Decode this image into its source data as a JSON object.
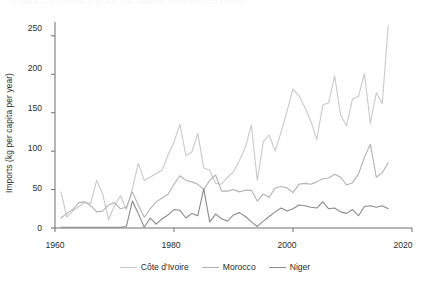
{
  "figure": {
    "clipped_top_text": "Figure 3.2  Cereal imports per capita, selected countries"
  },
  "chart_data": {
    "type": "line",
    "title": "",
    "xlabel": "",
    "ylabel": "Imports (kg per capita per year)",
    "xlim": [
      1960,
      2020
    ],
    "ylim": [
      0,
      268
    ],
    "xticks": [
      1960,
      1980,
      2000,
      2020
    ],
    "yticks": [
      0,
      50,
      100,
      150,
      200,
      250
    ],
    "grid": false,
    "legend_position": "bottom-center",
    "x": [
      1961,
      1962,
      1963,
      1964,
      1965,
      1966,
      1967,
      1968,
      1969,
      1970,
      1971,
      1972,
      1973,
      1974,
      1975,
      1976,
      1977,
      1978,
      1979,
      1980,
      1981,
      1982,
      1983,
      1984,
      1985,
      1986,
      1987,
      1988,
      1989,
      1990,
      1991,
      1992,
      1993,
      1994,
      1995,
      1996,
      1997,
      1998,
      1999,
      2000,
      2001,
      2002,
      2003,
      2004,
      2005,
      2006,
      2007,
      2008,
      2009,
      2010,
      2011,
      2012,
      2013,
      2014,
      2015,
      2016
    ],
    "series": [
      {
        "name": "Côte d'Ivoire",
        "color": "#c9c9c9",
        "values": [
          47,
          14,
          22,
          28,
          33,
          32,
          62,
          45,
          11,
          29,
          42,
          24,
          51,
          84,
          62,
          66,
          71,
          75,
          95,
          112,
          135,
          94,
          99,
          123,
          78,
          75,
          58,
          57,
          66,
          73,
          88,
          105,
          134,
          62,
          112,
          121,
          100,
          125,
          152,
          181,
          172,
          157,
          139,
          115,
          160,
          163,
          198,
          147,
          133,
          168,
          171,
          201,
          136,
          176,
          162,
          263
        ]
      },
      {
        "name": "Morocco",
        "color": "#b2b2b2",
        "values": [
          13,
          19,
          24,
          33,
          34,
          29,
          21,
          22,
          30,
          33,
          25,
          27,
          47,
          30,
          14,
          25,
          34,
          39,
          44,
          57,
          68,
          62,
          60,
          57,
          50,
          62,
          69,
          48,
          48,
          50,
          47,
          49,
          49,
          35,
          44,
          40,
          52,
          54,
          52,
          46,
          57,
          58,
          57,
          60,
          64,
          65,
          70,
          66,
          56,
          59,
          70,
          92,
          109,
          66,
          72,
          85
        ]
      },
      {
        "name": "Niger",
        "color": "#8a8a8a",
        "values": [
          1,
          1,
          1,
          1,
          1,
          1,
          1,
          1,
          1,
          1,
          1,
          2,
          35,
          19,
          1,
          13,
          5,
          12,
          17,
          24,
          23,
          13,
          19,
          16,
          51,
          8,
          18,
          12,
          9,
          17,
          20,
          15,
          8,
          2,
          9,
          15,
          21,
          26,
          22,
          25,
          30,
          29,
          27,
          26,
          34,
          25,
          26,
          21,
          19,
          24,
          16,
          28,
          29,
          27,
          29,
          25
        ]
      }
    ]
  },
  "axis": {
    "ytick_labels": [
      "250",
      "200",
      "150",
      "100",
      "50",
      "0"
    ],
    "xtick_labels": [
      "1960",
      "1980",
      "2000",
      "2020"
    ]
  },
  "legend": {
    "items": [
      {
        "label": "Côte d'Ivoire",
        "color": "#c9c9c9"
      },
      {
        "label": "Morocco",
        "color": "#b2b2b2"
      },
      {
        "label": "Niger",
        "color": "#8a8a8a"
      }
    ]
  },
  "colors": {
    "axis": "#6f6f6f",
    "text": "#2b2b2b",
    "background": "#ffffff"
  }
}
